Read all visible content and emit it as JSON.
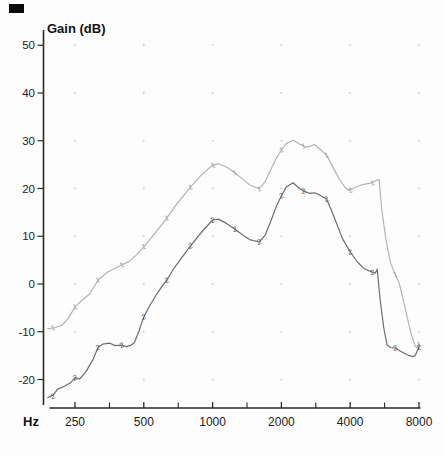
{
  "chart_data": {
    "type": "line",
    "title": "",
    "y_axis_title": "Gain (dB)",
    "x_axis_unit": "Hz",
    "x_scale": "log-frequency",
    "xlim": [
      190,
      8100
    ],
    "ylim": [
      -25,
      53
    ],
    "x_ticks": [
      250,
      500,
      1000,
      2000,
      4000,
      8000
    ],
    "x_tick_labels": [
      "250",
      "500",
      "1000",
      "2000",
      "4000",
      "8000"
    ],
    "x_ticks_minor": [
      354,
      707,
      1414,
      2828,
      5657
    ],
    "y_ticks": [
      50,
      40,
      30,
      20,
      10,
      0,
      -10,
      -20
    ],
    "y_tick_labels": [
      "50",
      "40",
      "30",
      "20",
      "10",
      "0",
      "-10",
      "-20"
    ],
    "grid": "dots-at-octave-by-10dB-intersections",
    "grid_x": [
      250,
      500,
      1000,
      2000,
      4000,
      8000
    ],
    "legend_position": "none",
    "colors": {
      "axis": "#2a2a2a",
      "text": "#1b1b1b",
      "grid": "#c9c9c9",
      "background": "#fdfdfd"
    },
    "series": [
      {
        "name": "gain-curve-1",
        "marker_glyph": "1",
        "color": "#b3b3b3",
        "marker_color": "#9e9e9e",
        "markers": [
          [
            200,
            -9.2
          ],
          [
            250,
            -4.8
          ],
          [
            315,
            0.8
          ],
          [
            400,
            4.0
          ],
          [
            500,
            7.8
          ],
          [
            630,
            13.8
          ],
          [
            800,
            20.3
          ],
          [
            1000,
            24.9
          ],
          [
            1250,
            23.3
          ],
          [
            1600,
            19.9
          ],
          [
            2000,
            28.1
          ],
          [
            2500,
            28.9
          ],
          [
            3150,
            27.0
          ],
          [
            4000,
            19.6
          ],
          [
            5000,
            21.2
          ],
          [
            6300,
            2.0
          ],
          [
            8000,
            -12.6
          ]
        ],
        "points": [
          [
            190,
            -9.4
          ],
          [
            205,
            -9.1
          ],
          [
            220,
            -8.6
          ],
          [
            235,
            -7.0
          ],
          [
            250,
            -4.8
          ],
          [
            270,
            -3.3
          ],
          [
            290,
            -2.1
          ],
          [
            315,
            0.8
          ],
          [
            345,
            2.4
          ],
          [
            375,
            3.3
          ],
          [
            400,
            4.0
          ],
          [
            430,
            4.7
          ],
          [
            465,
            6.1
          ],
          [
            500,
            7.8
          ],
          [
            550,
            10.2
          ],
          [
            590,
            12.0
          ],
          [
            630,
            13.8
          ],
          [
            700,
            16.9
          ],
          [
            750,
            18.6
          ],
          [
            800,
            20.3
          ],
          [
            900,
            23.0
          ],
          [
            1000,
            24.9
          ],
          [
            1060,
            25.2
          ],
          [
            1150,
            24.5
          ],
          [
            1250,
            23.3
          ],
          [
            1350,
            22.0
          ],
          [
            1450,
            20.8
          ],
          [
            1600,
            19.9
          ],
          [
            1700,
            21.5
          ],
          [
            1800,
            24.0
          ],
          [
            1900,
            26.3
          ],
          [
            2000,
            28.1
          ],
          [
            2100,
            29.4
          ],
          [
            2250,
            30.1
          ],
          [
            2400,
            29.3
          ],
          [
            2500,
            28.9
          ],
          [
            2600,
            28.7
          ],
          [
            2800,
            29.2
          ],
          [
            2950,
            28.2
          ],
          [
            3150,
            27.0
          ],
          [
            3400,
            24.0
          ],
          [
            3600,
            21.8
          ],
          [
            3800,
            20.2
          ],
          [
            3950,
            19.6
          ],
          [
            4150,
            20.1
          ],
          [
            4450,
            20.7
          ],
          [
            4750,
            21.0
          ],
          [
            5000,
            21.2
          ],
          [
            5200,
            21.7
          ],
          [
            5350,
            21.9
          ],
          [
            5500,
            15.5
          ],
          [
            5750,
            9.0
          ],
          [
            6000,
            4.5
          ],
          [
            6300,
            2.0
          ],
          [
            6550,
            0.2
          ],
          [
            6800,
            -3.0
          ],
          [
            7100,
            -7.0
          ],
          [
            7400,
            -10.5
          ],
          [
            7700,
            -13.0
          ],
          [
            7850,
            -13.4
          ],
          [
            8000,
            -12.6
          ]
        ]
      },
      {
        "name": "gain-curve-2",
        "marker_glyph": "2",
        "color": "#6d6d6d",
        "marker_color": "#555555",
        "markers": [
          [
            200,
            -23.5
          ],
          [
            250,
            -19.6
          ],
          [
            315,
            -13.3
          ],
          [
            400,
            -12.8
          ],
          [
            500,
            -6.9
          ],
          [
            630,
            0.8
          ],
          [
            800,
            8.0
          ],
          [
            1000,
            13.4
          ],
          [
            1250,
            11.5
          ],
          [
            1600,
            8.8
          ],
          [
            2000,
            18.5
          ],
          [
            2500,
            19.5
          ],
          [
            3150,
            17.8
          ],
          [
            4000,
            6.7
          ],
          [
            5000,
            2.5
          ],
          [
            6300,
            -13.4
          ],
          [
            8000,
            -13.2
          ]
        ],
        "points": [
          [
            190,
            -23.8
          ],
          [
            200,
            -23.3
          ],
          [
            210,
            -22.0
          ],
          [
            225,
            -21.4
          ],
          [
            240,
            -20.6
          ],
          [
            250,
            -19.6
          ],
          [
            262,
            -19.9
          ],
          [
            280,
            -18.3
          ],
          [
            300,
            -15.8
          ],
          [
            315,
            -13.3
          ],
          [
            330,
            -12.6
          ],
          [
            355,
            -12.4
          ],
          [
            375,
            -12.9
          ],
          [
            400,
            -12.8
          ],
          [
            420,
            -13.1
          ],
          [
            440,
            -12.8
          ],
          [
            455,
            -12.3
          ],
          [
            475,
            -10.0
          ],
          [
            500,
            -6.9
          ],
          [
            530,
            -4.6
          ],
          [
            565,
            -2.4
          ],
          [
            600,
            -0.5
          ],
          [
            630,
            0.8
          ],
          [
            680,
            3.4
          ],
          [
            740,
            5.8
          ],
          [
            800,
            8.0
          ],
          [
            900,
            11.0
          ],
          [
            1000,
            13.4
          ],
          [
            1060,
            13.6
          ],
          [
            1150,
            12.7
          ],
          [
            1250,
            11.5
          ],
          [
            1350,
            10.3
          ],
          [
            1450,
            9.3
          ],
          [
            1600,
            8.8
          ],
          [
            1700,
            10.3
          ],
          [
            1800,
            13.2
          ],
          [
            1900,
            16.2
          ],
          [
            2000,
            18.5
          ],
          [
            2100,
            20.3
          ],
          [
            2250,
            21.2
          ],
          [
            2400,
            20.0
          ],
          [
            2500,
            19.5
          ],
          [
            2650,
            19.0
          ],
          [
            2800,
            19.1
          ],
          [
            2950,
            18.6
          ],
          [
            3150,
            17.8
          ],
          [
            3300,
            15.6
          ],
          [
            3500,
            12.5
          ],
          [
            3700,
            9.5
          ],
          [
            4000,
            6.7
          ],
          [
            4300,
            4.6
          ],
          [
            4600,
            3.2
          ],
          [
            5000,
            2.5
          ],
          [
            5150,
            2.3
          ],
          [
            5250,
            3.1
          ],
          [
            5400,
            -3.0
          ],
          [
            5600,
            -9.0
          ],
          [
            5800,
            -12.8
          ],
          [
            6000,
            -13.3
          ],
          [
            6300,
            -13.4
          ],
          [
            6700,
            -14.2
          ],
          [
            7100,
            -14.8
          ],
          [
            7500,
            -15.2
          ],
          [
            7700,
            -15.0
          ],
          [
            8000,
            -13.2
          ]
        ]
      }
    ]
  }
}
